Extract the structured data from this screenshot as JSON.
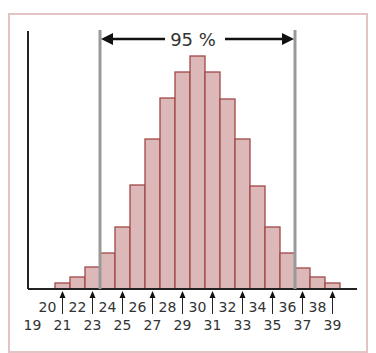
{
  "chart_data": {
    "type": "bar",
    "title": "",
    "xlabel": "",
    "ylabel": "",
    "categories": [
      "21",
      "22",
      "23",
      "24",
      "25",
      "26",
      "27",
      "28",
      "29",
      "30",
      "31",
      "32",
      "33",
      "34",
      "35",
      "36",
      "37",
      "38",
      "39"
    ],
    "values": [
      6,
      12,
      22,
      36,
      62,
      104,
      150,
      191,
      217,
      233,
      217,
      190,
      150,
      103,
      62,
      36,
      21,
      12,
      6
    ],
    "value_units": "relative bar height (pixels, unlabeled y-axis)",
    "ylim": [
      0,
      258
    ],
    "grid": false,
    "legend": null,
    "annotation": {
      "label": "95 %",
      "range_from": 23.5,
      "range_to": 36.5,
      "style": "double-headed arrow between two gray vertical lines"
    },
    "x_tick_labels_top_row": [
      "20",
      "22",
      "24",
      "26",
      "28",
      "30",
      "32",
      "34",
      "36",
      "38"
    ],
    "x_tick_labels_bottom_row": [
      "19",
      "21",
      "23",
      "25",
      "27",
      "29",
      "31",
      "33",
      "35",
      "37",
      "39"
    ],
    "x_arrow_markers": [
      "21",
      "23",
      "25",
      "27",
      "29",
      "31",
      "33",
      "35",
      "37",
      "39"
    ],
    "colors": {
      "bar_fill": "#dcb8b8",
      "bar_edge": "#a04848",
      "frame": "#e3c3c3",
      "range_line": "#999999",
      "axis": "#222222"
    }
  }
}
